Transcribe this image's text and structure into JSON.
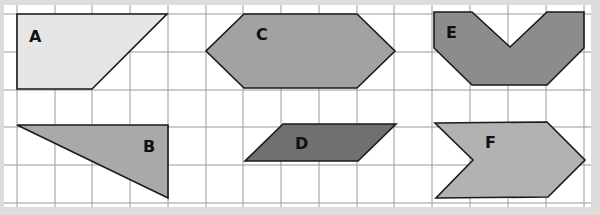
{
  "grid": {
    "x_lines": [
      17,
      55,
      92,
      130,
      168,
      206,
      243,
      281,
      319,
      357,
      394,
      432,
      470,
      508,
      546,
      584
    ],
    "y_lines": [
      14,
      52,
      90,
      127,
      165,
      203
    ],
    "line_color": "#9a9a9a",
    "paper_color": "#ffffff",
    "background_color": "#dcdcdc"
  },
  "shapes": [
    {
      "id": "A",
      "label": "A",
      "fill": "#e6e6e6",
      "points": "17,14 167,14 92,89 17,89",
      "label_pos": [
        29,
        42
      ]
    },
    {
      "id": "B",
      "label": "B",
      "fill": "#a9a9a9",
      "points": "17,125 168,125 168,198",
      "label_pos": [
        143,
        152
      ]
    },
    {
      "id": "C",
      "label": "C",
      "fill": "#a2a2a2",
      "points": "244,14 357,14 395,51 357,88 244,88 206,51",
      "label_pos": [
        256,
        40
      ]
    },
    {
      "id": "D",
      "label": "D",
      "fill": "#707070",
      "points": "283,124 396,124 358,161 245,161",
      "label_pos": [
        295,
        149
      ]
    },
    {
      "id": "E",
      "label": "E",
      "fill": "#8c8c8c",
      "points": "434,12 472,12 510,47 547,12 584,12 584,48 547,85 472,85 434,48",
      "label_pos": [
        446,
        38
      ]
    },
    {
      "id": "F",
      "label": "F",
      "fill": "#b2b2b2",
      "points": "435,123 547,122 585,160 548,197 436,198 473,160",
      "label_pos": [
        485,
        148
      ]
    }
  ]
}
